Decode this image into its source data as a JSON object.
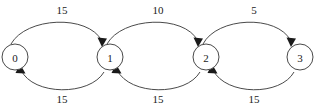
{
  "diagram": {
    "type": "directed-weighted-graph",
    "background_color": "#ffffff",
    "stroke_color": "#4a4a4a",
    "text_color": "#1a1a1a",
    "nodes": [
      {
        "id": "n0",
        "label": "0",
        "cx": 15,
        "cy": 57,
        "r": 13
      },
      {
        "id": "n1",
        "label": "1",
        "cx": 110,
        "cy": 57,
        "r": 13
      },
      {
        "id": "n2",
        "label": "2",
        "cx": 206,
        "cy": 57,
        "r": 13
      },
      {
        "id": "n3",
        "label": "3",
        "cx": 300,
        "cy": 57,
        "r": 13
      }
    ],
    "edges": [
      {
        "id": "e01",
        "from": "0",
        "to": "1",
        "weight": "15",
        "side": "top",
        "label_x": 62,
        "label_y": 10
      },
      {
        "id": "e10",
        "from": "1",
        "to": "0",
        "weight": "15",
        "side": "bottom",
        "label_x": 62,
        "label_y": 99
      },
      {
        "id": "e12",
        "from": "1",
        "to": "2",
        "weight": "10",
        "side": "top",
        "label_x": 158,
        "label_y": 10
      },
      {
        "id": "e21",
        "from": "2",
        "to": "1",
        "weight": "15",
        "side": "bottom",
        "label_x": 158,
        "label_y": 99
      },
      {
        "id": "e23",
        "from": "2",
        "to": "3",
        "weight": "5",
        "side": "top",
        "label_x": 254,
        "label_y": 10
      },
      {
        "id": "e32",
        "from": "3",
        "to": "2",
        "weight": "15",
        "side": "bottom",
        "label_x": 254,
        "label_y": 99
      }
    ]
  }
}
